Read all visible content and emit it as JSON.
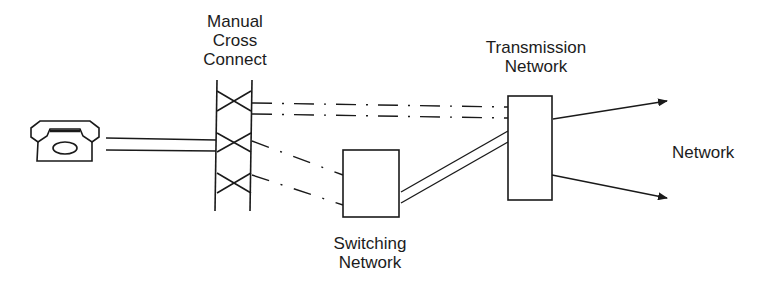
{
  "labels": {
    "cross_connect": [
      "Manual",
      "Cross",
      "Connect"
    ],
    "transmission": [
      "Transmission",
      "Network"
    ],
    "switching": [
      "Switching",
      "Network"
    ],
    "network": "Network"
  },
  "icons": {
    "telephone": "telephone-icon"
  },
  "colors": {
    "stroke": "#1a1a1a",
    "background": "#ffffff"
  }
}
